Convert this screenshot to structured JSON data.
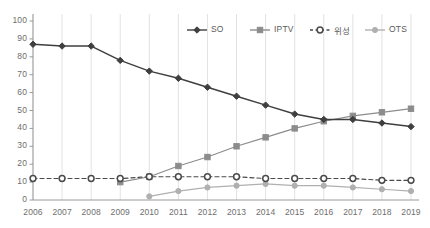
{
  "chart_data": {
    "type": "line",
    "title": "",
    "subtitle": "",
    "xlabel": "",
    "ylabel": "",
    "categories": [
      "2006",
      "2007",
      "2008",
      "2009",
      "2010",
      "2011",
      "2012",
      "2013",
      "2014",
      "2015",
      "2016",
      "2017",
      "2018",
      "2019"
    ],
    "x": [
      2006,
      2007,
      2008,
      2009,
      2010,
      2011,
      2012,
      2013,
      2014,
      2015,
      2016,
      2017,
      2018,
      2019
    ],
    "ylim": [
      0,
      100
    ],
    "xlim": [
      2006,
      2019
    ],
    "ytick_labels": [
      "0",
      "10",
      "20",
      "30",
      "40",
      "50",
      "60",
      "70",
      "80",
      "90",
      "100"
    ],
    "ytick_values": [
      0,
      10,
      20,
      30,
      40,
      50,
      60,
      70,
      80,
      90,
      100
    ],
    "grid": {
      "horizontal": false,
      "vertical": true
    },
    "legend_position": "top-right",
    "series": [
      {
        "name": "SO",
        "marker": "diamond",
        "line_style": "solid",
        "color": "#3f3f3f",
        "values": [
          87,
          86,
          86,
          78,
          72,
          68,
          63,
          58,
          53,
          48,
          45,
          45,
          43,
          41
        ]
      },
      {
        "name": "IPTV",
        "marker": "square",
        "line_style": "solid",
        "color": "#8c8c8c",
        "values": [
          null,
          null,
          null,
          10,
          13,
          19,
          24,
          30,
          35,
          40,
          44,
          47,
          49,
          51
        ]
      },
      {
        "name": "위성",
        "marker": "circle-open",
        "line_style": "dashed",
        "color": "#4a4a4a",
        "values": [
          12,
          12,
          12,
          12,
          13,
          13,
          13,
          13,
          12,
          12,
          12,
          12,
          11,
          11
        ]
      },
      {
        "name": "OTS",
        "marker": "circle",
        "line_style": "solid",
        "color": "#b0b0b0",
        "values": [
          null,
          null,
          null,
          null,
          2,
          5,
          7,
          8,
          9,
          8,
          8,
          7,
          6,
          5
        ]
      }
    ]
  },
  "legend": {
    "items": [
      {
        "label": "SO"
      },
      {
        "label": "IPTV"
      },
      {
        "label": "위성"
      },
      {
        "label": "OTS"
      }
    ]
  },
  "colors": {
    "so": "#3f3f3f",
    "iptv": "#8c8c8c",
    "satellite": "#4a4a4a",
    "ots": "#b0b0b0",
    "axis": "#9a9a9a",
    "gridline": "#e2e2e2",
    "tick_text": "#6e6e6e",
    "background": "#ffffff"
  }
}
